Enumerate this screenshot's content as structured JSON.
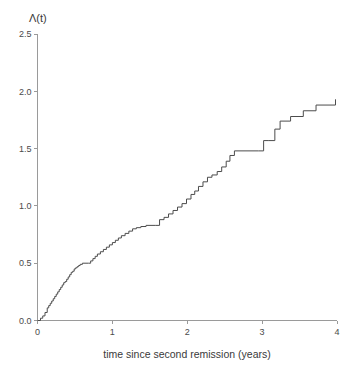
{
  "figure": {
    "ylabel": "Λ(t)",
    "xlabel": "time since second remission (years)",
    "line_color": "#4c4c4c",
    "axis_color": "#9a9a9a"
  },
  "chart_data": {
    "type": "line",
    "title": "",
    "subtitle": "",
    "xlabel": "time since second remission (years)",
    "ylabel": "Λ(t)",
    "xlim": [
      0,
      4
    ],
    "ylim": [
      0,
      2.5
    ],
    "xticks": [
      0,
      1,
      2,
      3,
      4
    ],
    "xtick_labels": [
      "0",
      "1",
      "2",
      "3",
      "4"
    ],
    "yticks": [
      0.0,
      0.5,
      1.0,
      1.5,
      2.0,
      2.5
    ],
    "ytick_labels": [
      "0.0",
      "0.5",
      "1.0",
      "1.5",
      "2.0",
      "2.5"
    ],
    "grid": false,
    "legend": null,
    "annotations": [],
    "series": [
      {
        "name": "Nelson-Aalen cumulative hazard",
        "style": "step-post",
        "x": [
          0.0,
          0.04,
          0.07,
          0.1,
          0.13,
          0.15,
          0.17,
          0.19,
          0.21,
          0.23,
          0.25,
          0.27,
          0.29,
          0.31,
          0.33,
          0.35,
          0.37,
          0.39,
          0.41,
          0.43,
          0.45,
          0.47,
          0.49,
          0.51,
          0.53,
          0.55,
          0.57,
          0.6,
          0.68,
          0.71,
          0.74,
          0.77,
          0.8,
          0.84,
          0.88,
          0.92,
          0.96,
          1.0,
          1.04,
          1.08,
          1.12,
          1.17,
          1.22,
          1.27,
          1.32,
          1.38,
          1.45,
          1.58,
          1.63,
          1.69,
          1.75,
          1.81,
          1.87,
          1.93,
          1.99,
          2.05,
          2.1,
          2.15,
          2.21,
          2.27,
          2.33,
          2.4,
          2.46,
          2.52,
          2.57,
          2.63,
          2.95,
          3.02,
          3.09,
          3.17,
          3.24,
          3.38,
          3.55,
          3.72,
          3.98
        ],
        "y": [
          0.0,
          0.02,
          0.04,
          0.07,
          0.11,
          0.13,
          0.15,
          0.17,
          0.19,
          0.21,
          0.23,
          0.25,
          0.27,
          0.29,
          0.31,
          0.33,
          0.34,
          0.36,
          0.38,
          0.4,
          0.42,
          0.43,
          0.45,
          0.46,
          0.47,
          0.48,
          0.49,
          0.5,
          0.5,
          0.52,
          0.54,
          0.56,
          0.58,
          0.6,
          0.62,
          0.64,
          0.66,
          0.68,
          0.7,
          0.72,
          0.74,
          0.76,
          0.78,
          0.8,
          0.81,
          0.82,
          0.83,
          0.83,
          0.88,
          0.9,
          0.93,
          0.96,
          0.99,
          1.02,
          1.06,
          1.1,
          1.13,
          1.17,
          1.21,
          1.25,
          1.27,
          1.3,
          1.34,
          1.39,
          1.44,
          1.48,
          1.48,
          1.57,
          1.57,
          1.67,
          1.74,
          1.78,
          1.83,
          1.88,
          1.93
        ]
      }
    ]
  }
}
